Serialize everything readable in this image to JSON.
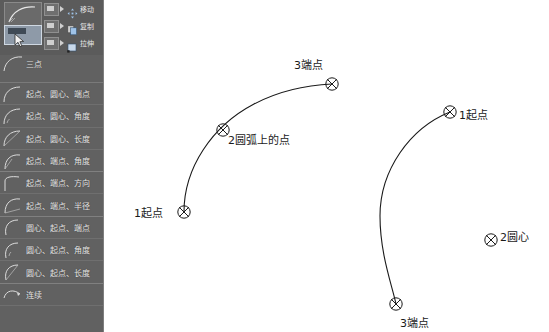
{
  "ribbon": {
    "big_button": {
      "name": "arc-tool-button"
    },
    "selected_button": {
      "name": "arc-dropdown-button"
    },
    "commands": [
      {
        "label": "移动",
        "icon": "move-icon"
      },
      {
        "label": "复制",
        "icon": "copy-icon"
      },
      {
        "label": "拉伸",
        "icon": "stretch-icon"
      }
    ]
  },
  "flyout": {
    "header": {
      "label": "三点",
      "icon": "arc-3point-icon"
    },
    "items": [
      {
        "label": "起点、圆心、端点",
        "icon": "arc-start-center-end-icon"
      },
      {
        "label": "起点、圆心、角度",
        "icon": "arc-start-center-angle-icon"
      },
      {
        "label": "起点、圆心、长度",
        "icon": "arc-start-center-length-icon"
      },
      {
        "label": "起点、端点、角度",
        "icon": "arc-start-end-angle-icon"
      },
      {
        "label": "起点、端点、方向",
        "icon": "arc-start-end-direction-icon"
      },
      {
        "label": "起点、端点、半径",
        "icon": "arc-start-end-radius-icon"
      },
      {
        "label": "圆心、起点、端点",
        "icon": "arc-center-start-end-icon"
      },
      {
        "label": "圆心、起点、角度",
        "icon": "arc-center-start-angle-icon"
      },
      {
        "label": "圆心、起点、长度",
        "icon": "arc-center-start-length-icon"
      },
      {
        "label": "连续",
        "icon": "arc-continue-icon"
      }
    ]
  },
  "canvas": {
    "arcs": [
      {
        "name": "arc-three-point",
        "path": "M 80 212 C 80 168 108 126 150 104 C 175 91 204 85 228 84",
        "markers": [
          {
            "name": "arc-point-marker-start-left",
            "x": 80,
            "y": 212
          },
          {
            "name": "arc-point-marker-middle-left",
            "x": 119,
            "y": 130
          },
          {
            "name": "arc-point-marker-end-left",
            "x": 228,
            "y": 84
          }
        ],
        "labels": [
          {
            "name": "label-1-start-left",
            "text": "1起点",
            "x": 30,
            "y": 204
          },
          {
            "name": "label-2-on-arc-left",
            "text": "2圆弧上的点",
            "x": 124,
            "y": 131
          },
          {
            "name": "label-3-end-left",
            "text": "3端点",
            "x": 190,
            "y": 56
          }
        ]
      },
      {
        "name": "arc-center-start-end",
        "path": "M 346 112 C 306 128 276 170 276 216 C 276 254 288 285 292 304",
        "markers": [
          {
            "name": "arc-point-marker-start-right",
            "x": 346,
            "y": 112
          },
          {
            "name": "arc-point-marker-center-right",
            "x": 387,
            "y": 240
          },
          {
            "name": "arc-point-marker-end-right",
            "x": 292,
            "y": 304
          }
        ],
        "labels": [
          {
            "name": "label-1-start-right",
            "text": "1起点",
            "x": 355,
            "y": 106
          },
          {
            "name": "label-2-center-right",
            "text": "2圆心",
            "x": 396,
            "y": 228
          },
          {
            "name": "label-3-end-right",
            "text": "3端点",
            "x": 296,
            "y": 314
          }
        ]
      }
    ]
  },
  "colors": {
    "panel_bg": "#616161",
    "ribbon_bg": "#5b5b5b",
    "highlight": "#8e9aa8",
    "text": "#e8e8e8",
    "canvas_bg": "#ffffff",
    "stroke": "#1a1a1a"
  }
}
